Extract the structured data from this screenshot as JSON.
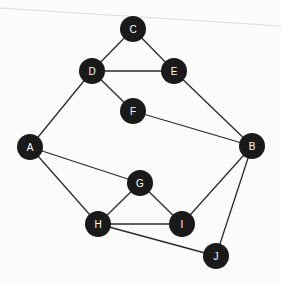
{
  "diagram": {
    "type": "undirected-graph",
    "colors": {
      "node_fill": "#1a1a1a",
      "node_label": "#ffffff",
      "edge": "#2b2b2b",
      "background": "#fbfbfa",
      "scan_line": "#c9c9c9"
    },
    "node_radius": 13,
    "nodes": [
      {
        "id": "A",
        "label": "A",
        "x": 30,
        "y": 147
      },
      {
        "id": "B",
        "label": "B",
        "x": 252,
        "y": 146
      },
      {
        "id": "C",
        "label": "C",
        "x": 133,
        "y": 29
      },
      {
        "id": "D",
        "label": "D",
        "x": 92,
        "y": 71
      },
      {
        "id": "E",
        "label": "E",
        "x": 174,
        "y": 71
      },
      {
        "id": "F",
        "label": "F",
        "x": 133,
        "y": 111
      },
      {
        "id": "G",
        "label": "G",
        "x": 140,
        "y": 183
      },
      {
        "id": "H",
        "label": "H",
        "x": 98,
        "y": 224
      },
      {
        "id": "I",
        "label": "I",
        "x": 182,
        "y": 224
      },
      {
        "id": "J",
        "label": "J",
        "x": 216,
        "y": 256
      }
    ],
    "edges": [
      [
        "C",
        "D"
      ],
      [
        "C",
        "E"
      ],
      [
        "D",
        "E"
      ],
      [
        "D",
        "F"
      ],
      [
        "D",
        "A"
      ],
      [
        "E",
        "B"
      ],
      [
        "F",
        "B"
      ],
      [
        "A",
        "G"
      ],
      [
        "A",
        "H"
      ],
      [
        "G",
        "H"
      ],
      [
        "G",
        "I"
      ],
      [
        "H",
        "I"
      ],
      [
        "H",
        "J"
      ],
      [
        "I",
        "B"
      ],
      [
        "B",
        "J"
      ]
    ]
  }
}
